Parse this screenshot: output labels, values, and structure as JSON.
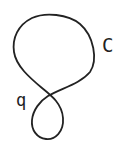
{
  "diagram": {
    "curve": {
      "name": "C",
      "stroke_color": "#222222",
      "stroke_width": 2
    },
    "labels": {
      "curve_label": "C",
      "point_label": "q"
    },
    "points": [
      {
        "name": "q",
        "role": "self-intersection"
      }
    ]
  }
}
